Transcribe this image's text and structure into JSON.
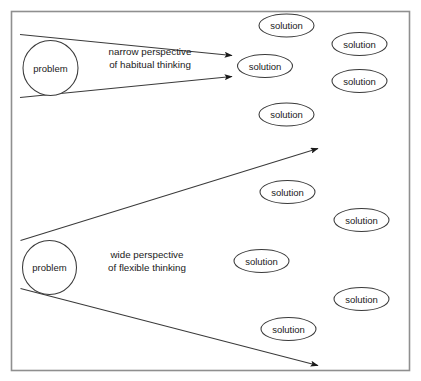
{
  "figure": {
    "background_color": "#ffffff",
    "border_color": "#8f8f8f",
    "stroke_color": "#3a3a3a",
    "text_color": "#1a1a1a"
  },
  "frame": {
    "label": "diagram-frame"
  },
  "cones": [
    {
      "id": "narrow-cone",
      "source_label": "problem",
      "caption_line1": "narrow perspective",
      "caption_line2": "of habitual thinking"
    },
    {
      "id": "wide-cone",
      "source_label": "problem",
      "caption_line1": "wide perspective",
      "caption_line2": "of flexible thinking"
    }
  ],
  "solutions": [
    {
      "id": "solution-top-center",
      "label": "solution",
      "cx": 286.5,
      "cy": 25.5,
      "rx": 27.5,
      "ry": 11.5
    },
    {
      "id": "solution-top-right",
      "label": "solution",
      "cx": 359.5,
      "cy": 44.0,
      "rx": 27.5,
      "ry": 11.5
    },
    {
      "id": "solution-narrow-target",
      "label": "solution",
      "cx": 265.0,
      "cy": 66.0,
      "rx": 27.5,
      "ry": 11.5
    },
    {
      "id": "solution-right-second",
      "label": "solution",
      "cx": 359.5,
      "cy": 81.0,
      "rx": 27.5,
      "ry": 11.5
    },
    {
      "id": "solution-center-upper",
      "label": "solution",
      "cx": 286.5,
      "cy": 114.5,
      "rx": 27.5,
      "ry": 11.5
    },
    {
      "id": "solution-center-mid",
      "label": "solution",
      "cx": 287.5,
      "cy": 192.0,
      "rx": 27.5,
      "ry": 11.5
    },
    {
      "id": "solution-right-third",
      "label": "solution",
      "cx": 361.5,
      "cy": 220.0,
      "rx": 27.5,
      "ry": 11.5
    },
    {
      "id": "solution-center-lower",
      "label": "solution",
      "cx": 261.5,
      "cy": 261.0,
      "rx": 27.5,
      "ry": 11.5
    },
    {
      "id": "solution-right-fourth",
      "label": "solution",
      "cx": 361.5,
      "cy": 299.0,
      "rx": 27.5,
      "ry": 11.5
    },
    {
      "id": "solution-bottom-center",
      "label": "solution",
      "cx": 288.5,
      "cy": 329.0,
      "rx": 27.5,
      "ry": 11.5
    }
  ],
  "problems": [
    {
      "id": "problem-top",
      "label": "problem",
      "cx": 50.5,
      "cy": 68.0,
      "r": 27.5
    },
    {
      "id": "problem-bottom",
      "label": "problem",
      "cx": 49.5,
      "cy": 267.5,
      "r": 27.0
    }
  ]
}
